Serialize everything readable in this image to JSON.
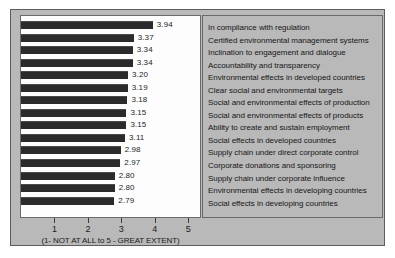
{
  "chart_data": {
    "type": "bar",
    "orientation": "horizontal",
    "title": "",
    "xlabel": "(1- NOT AT ALL to 5 - GREAT EXTENT)",
    "ylabel": "",
    "xlim": [
      0,
      5.35
    ],
    "grid": false,
    "legend_position": "right-panel",
    "xticks": [
      1,
      2,
      3,
      4,
      5
    ],
    "xticklabels": [
      "1",
      "2",
      "3",
      "4",
      "5"
    ],
    "categories": [
      "In compliance with regulation",
      "Certified environmental management systems",
      "Inclination to engagement and dialogue",
      "Accountability and transparency",
      "Environmental effects in developed countries",
      "Clear social and environmental targets",
      "Social and environmental effects of production",
      "Social and environmental effects of products",
      "Ability to create and sustain employment",
      "Social effects in developed countries",
      "Supply chain under direct corporate control",
      "Corporate donations and sponsoring",
      "Supply chain under corporate influence",
      "Environmental effects in developing countries",
      "Social effects in developing countries"
    ],
    "values": [
      3.94,
      3.37,
      3.34,
      3.34,
      3.2,
      3.19,
      3.18,
      3.15,
      3.15,
      3.11,
      2.98,
      2.97,
      2.8,
      2.8,
      2.79
    ],
    "value_labels": [
      "3.94",
      "3.37",
      "3.34",
      "3.34",
      "3.20",
      "3.19",
      "3.18",
      "3.15",
      "3.15",
      "3.11",
      "2.98",
      "2.97",
      "2.80",
      "2.80",
      "2.79"
    ],
    "bar_color": "#2b2b2b",
    "panel_color": "#b9b9b9",
    "plot_background": "#fdfdfd"
  }
}
